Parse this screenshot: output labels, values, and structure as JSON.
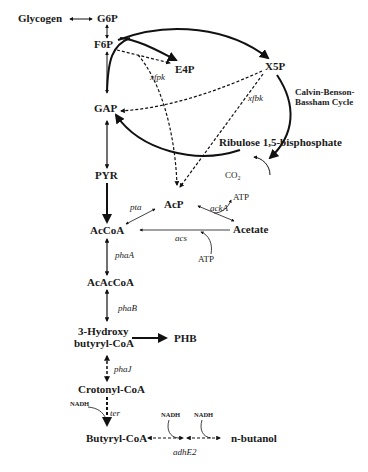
{
  "diagram": {
    "nodes": {
      "glycogen": "Glycogen",
      "g6p": "G6P",
      "f6p": "F6P",
      "e4p": "E4P",
      "x5p": "X5P",
      "gap": "GAP",
      "rubp": "Ribulose 1,5-bisphosphate",
      "pyr": "PYR",
      "acp": "AcP",
      "accoa": "AcCoA",
      "acetate": "Acetate",
      "acaccoa": "AcAcCoA",
      "hbcoa_line1": "3-Hydroxy",
      "hbcoa_line2": "butyryl-CoA",
      "phb": "PHB",
      "crotonyl": "Crotonyl-CoA",
      "butyryl": "Butyryl-CoA",
      "butanol": "n-butanol"
    },
    "cycle_label": [
      "Calvin-Benson-",
      "Bassham Cycle"
    ],
    "enzymes": {
      "xfpk_left": "xfpk",
      "xfpk_right": "xfbk",
      "pta": "pta",
      "acka": "ackA",
      "acs": "acs",
      "phaa": "phaA",
      "phab": "phaB",
      "phaj": "phaJ",
      "ter": "ter",
      "adhe2": "adhE2"
    },
    "cofactors": {
      "co2": "CO₂",
      "atp_acka": "ATP",
      "atp_acs": "ATP",
      "nadh_ter": "NADH",
      "nadh_adh1": "NADH",
      "nadh_adh2": "NADH"
    }
  }
}
